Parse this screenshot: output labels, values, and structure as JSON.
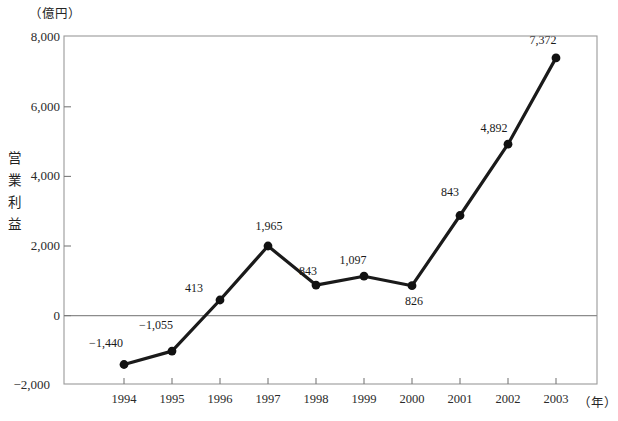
{
  "chart_data": {
    "type": "line",
    "title": "",
    "unit_label": "（億円）",
    "ylabel": "営業利益",
    "xlabel": "（年）",
    "categories": [
      "1994",
      "1995",
      "1996",
      "1997",
      "1998",
      "1999",
      "2000",
      "2001",
      "2002",
      "2003"
    ],
    "values": [
      -1440,
      -1055,
      413,
      1965,
      843,
      1097,
      826,
      2843,
      4892,
      7372
    ],
    "point_labels": [
      "−1,440",
      "−1,055",
      "413",
      "1,965",
      "843",
      "1,097",
      "826",
      "843",
      "4,892",
      "7,372"
    ],
    "ylim": [
      -2000,
      8000
    ],
    "yticks": [
      8000,
      6000,
      4000,
      2000,
      0,
      -2000
    ],
    "ytick_labels": [
      "8,000",
      "6,000",
      "4,000",
      "2,000",
      "0",
      "−2,000"
    ],
    "grid": false,
    "zero_line": true,
    "legend": "none",
    "series": [
      {
        "name": "営業利益",
        "values": [
          -1440,
          -1055,
          413,
          1965,
          843,
          1097,
          826,
          2843,
          4892,
          7372
        ]
      }
    ],
    "colors": {
      "line": "#1a1a1a",
      "marker": "#111111",
      "frame": "#9a9a9a",
      "zero_line": "#8c8c8c",
      "background": "#ffffff"
    }
  },
  "axis_title_chars": [
    "営",
    "業",
    "利",
    "益"
  ]
}
